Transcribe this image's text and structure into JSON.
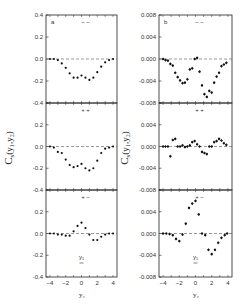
{
  "figure": {
    "panel_labels": [
      "a",
      "b"
    ],
    "row_labels": [
      "− −",
      "+ +",
      "+ −"
    ],
    "y_axis_label_left": "C",
    "y_axis_label_left_sub": "s",
    "y_axis_label_left_args": "(y₁,y₂)",
    "y_axis_label_right": "C",
    "y_axis_label_right_sub": "s",
    "y_axis_label_right_args": "(y₁,y₂)",
    "x_axis_label": "y₂",
    "y1_marker_label": "y₁"
  },
  "chart_data": [
    {
      "type": "scatter",
      "panel": "a",
      "row": "- -",
      "title": "",
      "xlabel": "y2",
      "ylabel": "Cs(y1,y2)",
      "xlim": [
        -4.5,
        4.5
      ],
      "ylim": [
        -0.4,
        0.4
      ],
      "y_ticks": [
        "0.4",
        "0.2",
        "0.0",
        "-0.2",
        "-0.4"
      ],
      "x": [
        -4.0,
        -3.5,
        -3.0,
        -2.5,
        -2.0,
        -1.5,
        -1.0,
        -0.5,
        0.0,
        0.5,
        1.0,
        1.5,
        2.0,
        2.5,
        3.0,
        3.5,
        4.0
      ],
      "values": [
        0.0,
        0.0,
        -0.01,
        -0.04,
        -0.08,
        -0.13,
        -0.17,
        -0.17,
        -0.15,
        -0.17,
        -0.19,
        -0.17,
        -0.12,
        -0.07,
        -0.03,
        -0.01,
        0.0
      ],
      "reference_line": 0.0
    },
    {
      "type": "scatter",
      "panel": "b",
      "row": "- -",
      "xlabel": "y2",
      "ylabel": "Cs(y1,y2)",
      "xlim": [
        -4.5,
        4.5
      ],
      "ylim": [
        -0.008,
        0.008
      ],
      "y_ticks": [
        "0.008",
        "0.004",
        "0.000",
        "-0.004",
        "-0.008"
      ],
      "x": [
        -4.0,
        -3.7,
        -3.4,
        -3.1,
        -2.8,
        -2.5,
        -2.2,
        -1.9,
        -1.6,
        -1.3,
        -1.0,
        -0.7,
        -0.4,
        -0.1,
        0.2,
        0.5,
        0.8,
        1.1,
        1.4,
        1.7,
        2.0,
        2.3,
        2.6,
        2.9,
        3.2,
        3.5,
        3.8
      ],
      "values": [
        0.0,
        -0.0002,
        -0.0003,
        -0.0009,
        -0.0012,
        -0.0025,
        -0.0033,
        -0.0039,
        -0.0044,
        -0.0043,
        -0.0037,
        -0.0019,
        -0.0017,
        0.0,
        0.0002,
        -0.0023,
        -0.0048,
        -0.0064,
        -0.0069,
        -0.0058,
        -0.0061,
        -0.0043,
        -0.0032,
        -0.0025,
        -0.0013,
        -0.001,
        -0.0007
      ],
      "reference_line": 0.0
    },
    {
      "type": "scatter",
      "panel": "a",
      "row": "+ +",
      "xlim": [
        -4.5,
        4.5
      ],
      "ylim": [
        -0.4,
        0.4
      ],
      "y_ticks": [
        "0.4",
        "0.2",
        "0.0",
        "-0.2",
        "-0.4"
      ],
      "x": [
        -4.0,
        -3.5,
        -3.0,
        -2.5,
        -2.0,
        -1.5,
        -1.0,
        -0.5,
        0.0,
        0.5,
        1.0,
        1.5,
        2.0,
        2.5,
        3.0,
        3.5,
        4.0
      ],
      "values": [
        0.0,
        -0.01,
        -0.05,
        -0.06,
        -0.12,
        -0.17,
        -0.19,
        -0.18,
        -0.16,
        -0.2,
        -0.22,
        -0.2,
        -0.13,
        -0.06,
        -0.02,
        -0.01,
        0.0
      ],
      "reference_line": 0.0
    },
    {
      "type": "scatter",
      "panel": "b",
      "row": "+ +",
      "xlim": [
        -4.5,
        4.5
      ],
      "ylim": [
        -0.008,
        0.008
      ],
      "y_ticks": [
        "0.008",
        "0.004",
        "0.000",
        "-0.004",
        "-0.008"
      ],
      "x": [
        -4.0,
        -3.7,
        -3.4,
        -3.1,
        -2.8,
        -2.5,
        -2.2,
        -1.9,
        -1.6,
        -1.3,
        -1.0,
        -0.7,
        -0.4,
        -0.1,
        0.2,
        0.5,
        0.8,
        1.1,
        1.4,
        1.7,
        2.0,
        2.3,
        2.6,
        2.9,
        3.2,
        3.5,
        3.8
      ],
      "values": [
        0.0,
        0.0,
        0.0,
        -0.0018,
        0.0012,
        0.0014,
        0.0,
        0.0,
        0.0002,
        -0.0001,
        0.0,
        0.0002,
        0.0008,
        0.001,
        0.0004,
        0.0,
        -0.001,
        -0.0012,
        -0.0014,
        0.0,
        0.0,
        0.0008,
        0.001,
        0.0014,
        0.0011,
        0.0006,
        0.0003
      ],
      "reference_line": 0.0
    },
    {
      "type": "scatter",
      "panel": "a",
      "row": "+ -",
      "xlim": [
        -4.5,
        4.5
      ],
      "ylim": [
        -0.4,
        0.4
      ],
      "y_ticks": [
        "0.4",
        "0.2",
        "0.0",
        "-0.2",
        "-0.4"
      ],
      "x_ticks": [
        "-4",
        "-2",
        "0",
        "2",
        "4"
      ],
      "x": [
        -4.0,
        -3.5,
        -3.0,
        -2.5,
        -2.0,
        -1.5,
        -1.0,
        -0.5,
        0.0,
        0.5,
        1.0,
        1.5,
        2.0,
        2.5,
        3.0,
        3.5,
        4.0
      ],
      "values": [
        0.0,
        0.0,
        -0.01,
        -0.01,
        -0.02,
        -0.02,
        0.02,
        0.07,
        0.1,
        0.05,
        -0.01,
        -0.06,
        -0.06,
        -0.03,
        -0.01,
        0.0,
        0.0
      ],
      "reference_line": 0.0,
      "annotation": "y1 marker at x=0"
    },
    {
      "type": "scatter",
      "panel": "b",
      "row": "+ -",
      "xlim": [
        -4.5,
        4.5
      ],
      "ylim": [
        -0.008,
        0.008
      ],
      "y_ticks": [
        "0.008",
        "0.004",
        "0.000",
        "-0.004",
        "-0.008"
      ],
      "x_ticks": [
        "-4",
        "-2",
        "0",
        "2",
        "4"
      ],
      "x": [
        -4.0,
        -3.6,
        -3.2,
        -2.8,
        -2.4,
        -2.0,
        -1.6,
        -1.2,
        -0.8,
        -0.4,
        0.0,
        0.4,
        0.8,
        1.2,
        1.6,
        2.0,
        2.4,
        2.8,
        3.2,
        3.6,
        3.9
      ],
      "values": [
        0.0,
        0.0,
        -0.0001,
        -0.0003,
        -0.001,
        -0.0014,
        -0.0002,
        0.0018,
        0.0047,
        0.0055,
        0.006,
        0.0035,
        0.0,
        -0.0003,
        -0.003,
        -0.0038,
        -0.003,
        -0.0017,
        -0.0008,
        -0.0003,
        0.0
      ],
      "reference_line": 0.0,
      "annotation": "y1 marker at x=0"
    }
  ]
}
